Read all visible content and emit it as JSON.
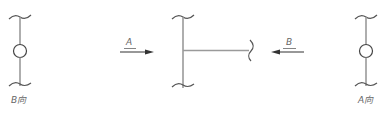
{
  "diagram": {
    "type": "technical-drawing-views",
    "colors": {
      "line": "#9a9a9a",
      "break_line": "#555555",
      "circle": "#444444",
      "arrow": "#333333",
      "label": "#666666"
    },
    "left_view": {
      "label": "B向",
      "has_circle": true
    },
    "center_view": {
      "shape": "T-joint",
      "arrow_a": {
        "label": "A",
        "direction": "right"
      },
      "arrow_b": {
        "label": "B",
        "direction": "left"
      }
    },
    "right_view": {
      "label": "A向",
      "has_circle": true
    }
  }
}
